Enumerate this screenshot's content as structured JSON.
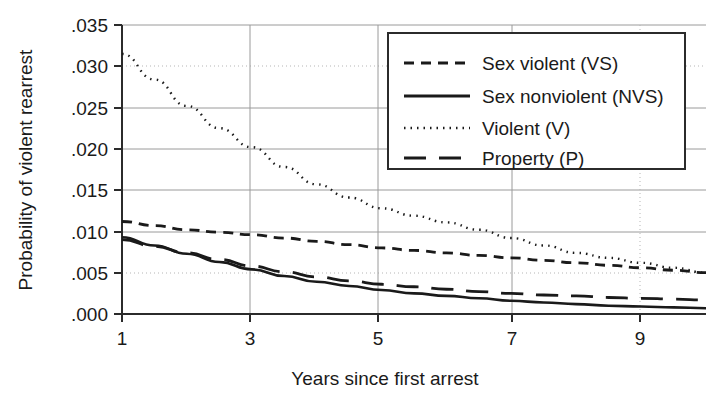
{
  "chart_data": {
    "type": "line",
    "title": "",
    "xlabel": "Years since first arrest",
    "ylabel": "Probability of violent rearrest",
    "xlim": [
      1,
      10
    ],
    "ylim": [
      0.0,
      0.035
    ],
    "xticks": [
      1,
      3,
      5,
      7,
      9
    ],
    "xtick_labels": [
      "1",
      "3",
      "5",
      "7",
      "9"
    ],
    "yticks": [
      0.0,
      0.005,
      0.01,
      0.015,
      0.02,
      0.025,
      0.03,
      0.035
    ],
    "ytick_labels": [
      ".000",
      ".005",
      ".010",
      ".015",
      ".020",
      ".025",
      ".030",
      ".035"
    ],
    "grid": true,
    "legend_position": "top-right",
    "x": [
      1,
      1.5,
      2,
      2.5,
      3,
      3.5,
      4,
      4.5,
      5,
      5.5,
      6,
      6.5,
      7,
      7.5,
      8,
      8.5,
      9,
      9.5,
      10
    ],
    "series": [
      {
        "name": "Sex violent (VS)",
        "style": "dashed",
        "values": [
          0.0112,
          0.0107,
          0.0102,
          0.0099,
          0.0096,
          0.0092,
          0.0088,
          0.0084,
          0.008,
          0.0077,
          0.0074,
          0.0071,
          0.0068,
          0.0065,
          0.0062,
          0.0059,
          0.0056,
          0.0053,
          0.005
        ]
      },
      {
        "name": "Sex nonviolent (NVS)",
        "style": "solid",
        "values": [
          0.0093,
          0.0083,
          0.0073,
          0.0063,
          0.0054,
          0.0046,
          0.0039,
          0.0034,
          0.0029,
          0.0025,
          0.0022,
          0.0019,
          0.0016,
          0.0014,
          0.0012,
          0.001,
          0.0009,
          0.0008,
          0.0007
        ]
      },
      {
        "name": "Violent (V)",
        "style": "dotted",
        "values": [
          0.0315,
          0.0284,
          0.0252,
          0.0225,
          0.0202,
          0.0178,
          0.0157,
          0.0141,
          0.0128,
          0.0119,
          0.0111,
          0.0102,
          0.0092,
          0.0083,
          0.0074,
          0.0068,
          0.0062,
          0.0056,
          0.005
        ]
      },
      {
        "name": "Property (P)",
        "style": "longdash",
        "values": [
          0.009,
          0.0082,
          0.0074,
          0.0066,
          0.0058,
          0.0051,
          0.0045,
          0.004,
          0.0036,
          0.0033,
          0.003,
          0.0027,
          0.0025,
          0.0023,
          0.0022,
          0.002,
          0.0019,
          0.0018,
          0.0017
        ]
      }
    ]
  },
  "legend": {
    "items": [
      {
        "label": "Sex violent (VS)",
        "style": "dashed"
      },
      {
        "label": "Sex nonviolent (NVS)",
        "style": "solid"
      },
      {
        "label": "Violent (V)",
        "style": "dotted"
      },
      {
        "label": "Property (P)",
        "style": "longdash"
      }
    ]
  },
  "axes": {
    "y_title": "Probability of violent rearrest",
    "x_title": "Years since first arrest",
    "y_labels": [
      ".035",
      ".030",
      ".025",
      ".020",
      ".015",
      ".010",
      ".005",
      ".000"
    ],
    "x_labels": [
      "1",
      "3",
      "5",
      "7",
      "9"
    ]
  },
  "colors": {
    "ink": "#1a1a1a",
    "grid": "#9a9a9a",
    "grid_light": "#b5b5b5",
    "background": "#ffffff"
  }
}
